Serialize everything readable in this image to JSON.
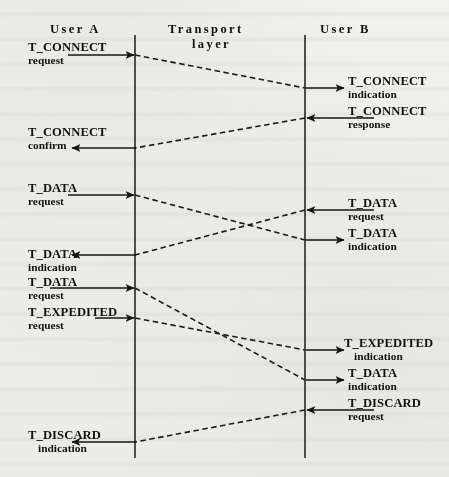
{
  "figure": {
    "kind": "time-sequence-diagram",
    "columns": [
      {
        "id": "user-a",
        "label": "User A",
        "x": 135
      },
      {
        "id": "transport-layer",
        "label": "Transport",
        "label2": "layer",
        "x": 220
      },
      {
        "id": "user-b",
        "label": "User B",
        "x": 305
      }
    ],
    "colors": {
      "ink": "#111111",
      "paper": "#f7f7f5",
      "line": "#1a1a1a"
    },
    "lifelines": {
      "top_y": 35,
      "bottom_y": 458
    },
    "left_events": [
      {
        "id": "t-connect-request",
        "kind": "T_CONNECT",
        "type": "request",
        "y": 55,
        "dir": "right"
      },
      {
        "id": "t-connect-confirm",
        "kind": "T_CONNECT",
        "type": "confirm",
        "y": 148,
        "dir": "left"
      },
      {
        "id": "t-data-request-1",
        "kind": "T_DATA",
        "type": "request",
        "y": 195,
        "dir": "right"
      },
      {
        "id": "t-data-indication-1",
        "kind": "T_DATA",
        "type": "indication",
        "y": 255,
        "dir": "left"
      },
      {
        "id": "t-data-request-2",
        "kind": "T_DATA",
        "type": "request",
        "y": 288,
        "dir": "right"
      },
      {
        "id": "t-expedited-request",
        "kind": "T_EXPEDITED",
        "type": "request",
        "y": 318,
        "dir": "right"
      },
      {
        "id": "t-discard-indication",
        "kind": "T_DISCARD",
        "type": "indication",
        "y": 442,
        "dir": "left"
      }
    ],
    "right_events": [
      {
        "id": "t-connect-indication",
        "kind": "T_CONNECT",
        "type": "indication",
        "y": 88,
        "dir": "right"
      },
      {
        "id": "t-connect-response",
        "kind": "T_CONNECT",
        "type": "response",
        "y": 118,
        "dir": "left"
      },
      {
        "id": "t-data-request-b",
        "kind": "T_DATA",
        "type": "request",
        "y": 210,
        "dir": "left"
      },
      {
        "id": "t-data-indication-b1",
        "kind": "T_DATA",
        "type": "indication",
        "y": 240,
        "dir": "right"
      },
      {
        "id": "t-expedited-indication",
        "kind": "T_EXPEDITED",
        "type": "indication",
        "y": 350,
        "dir": "right"
      },
      {
        "id": "t-data-indication-b2",
        "kind": "T_DATA",
        "type": "indication",
        "y": 380,
        "dir": "right"
      },
      {
        "id": "t-discard-request",
        "kind": "T_DISCARD",
        "type": "request",
        "y": 410,
        "dir": "left"
      }
    ],
    "transport_flows": [
      {
        "id": "flow-connect",
        "from_x": 135,
        "from_y": 55,
        "to_x": 305,
        "to_y": 88
      },
      {
        "id": "flow-connect-response",
        "from_x": 305,
        "from_y": 118,
        "to_x": 135,
        "to_y": 148
      },
      {
        "id": "flow-data-a-to-b",
        "from_x": 135,
        "from_y": 195,
        "to_x": 305,
        "to_y": 240
      },
      {
        "id": "flow-data-b-to-a",
        "from_x": 305,
        "from_y": 210,
        "to_x": 135,
        "to_y": 255
      },
      {
        "id": "flow-data-a-to-b-2",
        "from_x": 135,
        "from_y": 288,
        "to_x": 305,
        "to_y": 380
      },
      {
        "id": "flow-expedited-a-to-b",
        "from_x": 135,
        "from_y": 318,
        "to_x": 305,
        "to_y": 350
      },
      {
        "id": "flow-discard-b-to-a",
        "from_x": 305,
        "from_y": 410,
        "to_x": 135,
        "to_y": 442
      }
    ]
  }
}
